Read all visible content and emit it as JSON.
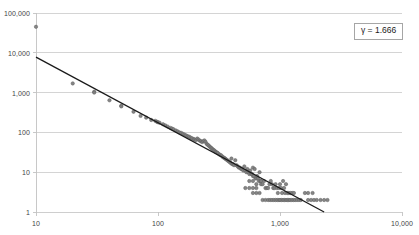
{
  "chart_data": {
    "type": "scatter",
    "title": "",
    "subtitle": "",
    "xlabel": "",
    "ylabel": "",
    "xscale": "log",
    "yscale": "log",
    "xlim": [
      10,
      10000
    ],
    "ylim": [
      1,
      100000
    ],
    "grid": "horizontal-major",
    "legend_position": "top-right",
    "x_ticks": [
      {
        "value": 10,
        "label": "10"
      },
      {
        "value": 100,
        "label": "100"
      },
      {
        "value": 1000,
        "label": "1,000"
      },
      {
        "value": 10000,
        "label": "10,000"
      }
    ],
    "y_ticks": [
      {
        "value": 1,
        "label": "1"
      },
      {
        "value": 10,
        "label": "10"
      },
      {
        "value": 100,
        "label": "100"
      },
      {
        "value": 1000,
        "label": "1,000"
      },
      {
        "value": 10000,
        "label": "10,000"
      },
      {
        "value": 100000,
        "label": "100,000"
      }
    ],
    "annotations": [
      {
        "name": "gamma-exponent",
        "text": "γ = 1.666",
        "position": "top-right",
        "boxed": true
      }
    ],
    "series": [
      {
        "name": "observations",
        "type": "scatter",
        "marker": "circle",
        "marker_color": "#808080",
        "marker_edge_color": "#5e5e5e",
        "marker_size_px": 3.4,
        "points": [
          [
            10,
            45000
          ],
          [
            20,
            1700
          ],
          [
            30,
            1050
          ],
          [
            30,
            1000
          ],
          [
            40,
            640
          ],
          [
            50,
            470
          ],
          [
            50,
            450
          ],
          [
            63,
            330
          ],
          [
            72,
            260
          ],
          [
            80,
            235
          ],
          [
            88,
            205
          ],
          [
            95,
            195
          ],
          [
            98,
            185
          ],
          [
            100,
            180
          ],
          [
            103,
            175
          ],
          [
            110,
            160
          ],
          [
            115,
            150
          ],
          [
            120,
            140
          ],
          [
            126,
            130
          ],
          [
            130,
            125
          ],
          [
            134,
            120
          ],
          [
            140,
            112
          ],
          [
            145,
            106
          ],
          [
            150,
            100
          ],
          [
            155,
            97
          ],
          [
            160,
            92
          ],
          [
            165,
            88
          ],
          [
            170,
            84
          ],
          [
            175,
            80
          ],
          [
            180,
            78
          ],
          [
            185,
            74
          ],
          [
            190,
            71
          ],
          [
            196,
            68
          ],
          [
            200,
            66
          ],
          [
            205,
            64
          ],
          [
            210,
            70
          ],
          [
            215,
            66
          ],
          [
            220,
            62
          ],
          [
            225,
            60
          ],
          [
            230,
            57
          ],
          [
            235,
            60
          ],
          [
            240,
            63
          ],
          [
            245,
            58
          ],
          [
            250,
            52
          ],
          [
            255,
            49
          ],
          [
            260,
            47
          ],
          [
            265,
            44
          ],
          [
            270,
            42
          ],
          [
            275,
            40
          ],
          [
            280,
            38
          ],
          [
            285,
            36
          ],
          [
            290,
            35
          ],
          [
            295,
            33
          ],
          [
            300,
            32
          ],
          [
            305,
            31
          ],
          [
            310,
            30
          ],
          [
            318,
            28
          ],
          [
            325,
            27
          ],
          [
            332,
            26
          ],
          [
            340,
            24
          ],
          [
            348,
            23
          ],
          [
            355,
            22
          ],
          [
            362,
            21
          ],
          [
            370,
            20
          ],
          [
            378,
            19
          ],
          [
            386,
            18
          ],
          [
            395,
            17
          ],
          [
            400,
            22
          ],
          [
            405,
            16
          ],
          [
            412,
            16
          ],
          [
            420,
            15
          ],
          [
            430,
            20
          ],
          [
            440,
            15
          ],
          [
            450,
            14
          ],
          [
            460,
            13
          ],
          [
            470,
            13
          ],
          [
            480,
            12
          ],
          [
            490,
            12
          ],
          [
            500,
            11
          ],
          [
            510,
            14
          ],
          [
            520,
            11
          ],
          [
            530,
            10
          ],
          [
            540,
            12
          ],
          [
            550,
            10
          ],
          [
            560,
            9
          ],
          [
            570,
            11
          ],
          [
            580,
            9
          ],
          [
            590,
            9
          ],
          [
            600,
            8
          ],
          [
            600,
            13
          ],
          [
            610,
            8
          ],
          [
            620,
            12
          ],
          [
            630,
            7
          ],
          [
            640,
            7
          ],
          [
            650,
            8
          ],
          [
            660,
            7
          ],
          [
            670,
            6
          ],
          [
            680,
            10
          ],
          [
            690,
            6
          ],
          [
            700,
            6
          ],
          [
            560,
            6
          ],
          [
            600,
            6
          ],
          [
            640,
            5
          ],
          [
            520,
            4
          ],
          [
            560,
            4
          ],
          [
            600,
            4
          ],
          [
            640,
            4
          ],
          [
            700,
            5
          ],
          [
            720,
            5
          ],
          [
            740,
            6
          ],
          [
            760,
            4
          ],
          [
            780,
            4
          ],
          [
            800,
            4
          ],
          [
            820,
            5
          ],
          [
            840,
            6
          ],
          [
            860,
            5
          ],
          [
            880,
            4
          ],
          [
            900,
            4
          ],
          [
            920,
            5
          ],
          [
            940,
            4
          ],
          [
            960,
            3
          ],
          [
            980,
            4
          ],
          [
            1000,
            5
          ],
          [
            1020,
            4
          ],
          [
            1040,
            3
          ],
          [
            1060,
            6
          ],
          [
            1080,
            4
          ],
          [
            1100,
            3
          ],
          [
            1120,
            5
          ],
          [
            1150,
            3
          ],
          [
            1180,
            3
          ],
          [
            1220,
            3
          ],
          [
            1260,
            3
          ],
          [
            1300,
            3
          ],
          [
            600,
            3
          ],
          [
            640,
            3
          ],
          [
            680,
            3
          ],
          [
            720,
            2
          ],
          [
            760,
            2
          ],
          [
            800,
            2
          ],
          [
            830,
            2
          ],
          [
            860,
            2
          ],
          [
            890,
            2
          ],
          [
            920,
            2
          ],
          [
            950,
            2
          ],
          [
            980,
            2
          ],
          [
            1000,
            2
          ],
          [
            1030,
            2
          ],
          [
            1060,
            2
          ],
          [
            1090,
            2
          ],
          [
            1120,
            2
          ],
          [
            1150,
            2
          ],
          [
            1180,
            2
          ],
          [
            1210,
            2
          ],
          [
            1250,
            2
          ],
          [
            1290,
            2
          ],
          [
            1330,
            2
          ],
          [
            1380,
            2
          ],
          [
            1430,
            2
          ],
          [
            1480,
            2
          ],
          [
            1600,
            3
          ],
          [
            1700,
            3
          ],
          [
            1850,
            3
          ],
          [
            1700,
            2
          ],
          [
            1800,
            2
          ],
          [
            1900,
            2
          ],
          [
            2000,
            2
          ],
          [
            2150,
            2
          ],
          [
            2300,
            2
          ],
          [
            2450,
            2
          ]
        ]
      },
      {
        "name": "power-law-fit",
        "type": "line",
        "line_color": "#1a1a1a",
        "line_width_px": 1.3,
        "slope_exponent": -1.666,
        "endpoints": [
          [
            10,
            7800
          ],
          [
            2300,
            1.0
          ]
        ]
      }
    ]
  }
}
